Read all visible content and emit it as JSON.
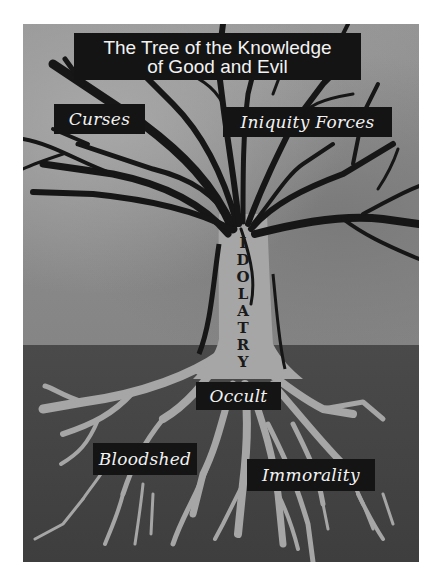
{
  "title": {
    "line1": "The Tree of the Knowledge",
    "line2": "of Good and Evil"
  },
  "labels": {
    "branches_left": "Curses",
    "branches_right": "Iniquity Forces",
    "trunk": [
      "I",
      "D",
      "O",
      "L",
      "A",
      "T",
      "R",
      "Y"
    ],
    "root_center": "Occult",
    "root_left": "Bloodshed",
    "root_right": "Immorality"
  },
  "colors": {
    "label_bg": "#141414",
    "label_text": "#f2f2f2",
    "sky": "#8e8e8e",
    "ground": "#444444",
    "trunk_roots": "#a6a6a6",
    "branches": "#161616"
  }
}
